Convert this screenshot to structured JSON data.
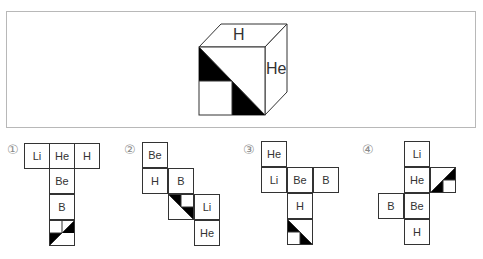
{
  "question": {
    "cube": {
      "top_face": "H",
      "right_face": "He",
      "front_face_pattern": "diagonal-tl-br-black-lower-left"
    }
  },
  "options": [
    {
      "number": "①",
      "cells": [
        {
          "label": "Li"
        },
        {
          "label": "He"
        },
        {
          "label": "H"
        },
        {
          "label": "Be"
        },
        {
          "label": "B"
        },
        {
          "label": "",
          "pattern": "diagonal-bl-tr"
        }
      ]
    },
    {
      "number": "②",
      "cells": [
        {
          "label": "Be"
        },
        {
          "label": "H"
        },
        {
          "label": "B"
        },
        {
          "label": "",
          "pattern": "diagonal-tl-br-upper"
        },
        {
          "label": "Li"
        },
        {
          "label": "He"
        }
      ]
    },
    {
      "number": "③",
      "cells": [
        {
          "label": "He"
        },
        {
          "label": "Li"
        },
        {
          "label": "Be"
        },
        {
          "label": "B"
        },
        {
          "label": "H"
        },
        {
          "label": "",
          "pattern": "diagonal-tl-br-lower"
        }
      ]
    },
    {
      "number": "④",
      "cells": [
        {
          "label": "Li"
        },
        {
          "label": "He"
        },
        {
          "label": "",
          "pattern": "diagonal-bl-tr-lower"
        },
        {
          "label": "B"
        },
        {
          "label": "Be"
        },
        {
          "label": "H"
        }
      ]
    }
  ],
  "colors": {
    "line": "#333333",
    "fill": "#000000",
    "box_border": "#b8b8b8",
    "number": "#8a8a8a"
  }
}
